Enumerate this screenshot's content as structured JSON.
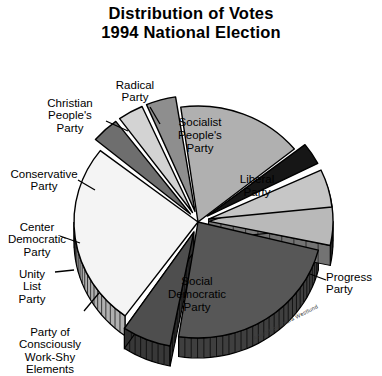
{
  "title": {
    "line1": "Distribution of Votes",
    "line2": "1994 National Election"
  },
  "credit": "Artwork by Laura Westlund",
  "labels": {
    "radical": "Radical\nParty",
    "christian": "Christian\nPeople's\nParty",
    "conservative": "Conservative\nParty",
    "center_democratic": "Center\nDemocratic\nParty",
    "unity_list": "Unity\nList\nParty",
    "work_shy": "Party of\nConsciously\nWork-Shy\nElements",
    "socialist": "Socialist\nPeople's\nParty",
    "liberal": "Liberal\nParty",
    "progress": "Progress\nParty",
    "social_democratic": "Social\nDemocratic\nParty"
  },
  "colors": {
    "socialist": "#b9b9b9",
    "liberal": "#575757",
    "progress": "#4e4e4e",
    "social_democratic": "#f4f4f4",
    "work_shy": "#6e6e6e",
    "unity_list": "#d3d3d3",
    "center_democratic": "#8e8e8e",
    "conservative": "#b0b0b0",
    "christian": "#161616",
    "radical": "#c6c6c6",
    "outline": "#000000",
    "background": "#ffffff"
  },
  "chart_data": {
    "type": "pie",
    "title": "Distribution of Votes 1994 National Election",
    "xlabel": "",
    "ylabel": "",
    "legend": "none",
    "grid": false,
    "exploded": true,
    "three_d": true,
    "categories": [
      "Socialist People's Party",
      "Liberal Party",
      "Progress Party",
      "Social Democratic Party",
      "Party of Consciously Work-Shy Elements",
      "Unity List Party",
      "Center Democratic Party",
      "Conservative Party",
      "Christian People's Party",
      "Radical Party"
    ],
    "values": [
      8.5,
      23.5,
      6.5,
      25.5,
      3.5,
      3.5,
      4.0,
      16.5,
      3.0,
      5.5
    ],
    "slices": [
      {
        "label": "Socialist People's Party",
        "value": 8.5,
        "start_angle": -19,
        "end_angle": 12,
        "color": "#b9b9b9",
        "exploded": true,
        "label_placement": "inside"
      },
      {
        "label": "Liberal Party",
        "value": 23.5,
        "start_angle": 14,
        "end_angle": 99,
        "color": "#575757",
        "exploded": false,
        "label_placement": "inside"
      },
      {
        "label": "Progress Party",
        "value": 6.5,
        "start_angle": 101,
        "end_angle": 124,
        "color": "#4e4e4e",
        "exploded": true,
        "label_placement": "outside"
      },
      {
        "label": "Social Democratic Party",
        "value": 25.5,
        "start_angle": 126,
        "end_angle": 218,
        "color": "#f4f4f4",
        "exploded": false,
        "label_placement": "inside"
      },
      {
        "label": "Party of Consciously Work-Shy Elements",
        "value": 3.5,
        "start_angle": 220,
        "end_angle": 233,
        "color": "#6e6e6e",
        "exploded": true,
        "label_placement": "outside"
      },
      {
        "label": "Unity List Party",
        "value": 3.5,
        "start_angle": 234,
        "end_angle": 246,
        "color": "#d3d3d3",
        "exploded": true,
        "label_placement": "outside"
      },
      {
        "label": "Center Democratic Party",
        "value": 4.0,
        "start_angle": 247,
        "end_angle": 261,
        "color": "#8e8e8e",
        "exploded": true,
        "label_placement": "outside"
      },
      {
        "label": "Conservative Party",
        "value": 16.5,
        "start_angle": 262,
        "end_angle": 321,
        "color": "#b0b0b0",
        "exploded": false,
        "label_placement": "outside"
      },
      {
        "label": "Christian People's Party",
        "value": 3.0,
        "start_angle": 322,
        "end_angle": 333,
        "color": "#161616",
        "exploded": true,
        "label_placement": "outside"
      },
      {
        "label": "Radical Party",
        "value": 5.5,
        "start_angle": 335,
        "end_angle": 354,
        "color": "#c6c6c6",
        "exploded": true,
        "label_placement": "outside"
      }
    ]
  }
}
